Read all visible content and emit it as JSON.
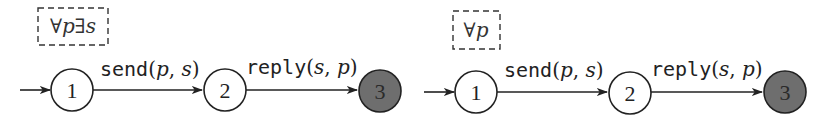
{
  "colors": {
    "stroke": "#222222",
    "final_fill": "#6e6e6e",
    "final_text": "#2a2a2a",
    "box_dash": "#333333"
  },
  "automata": [
    {
      "quantifier": "∀p∃s",
      "states": [
        {
          "label": "1",
          "initial": true,
          "final": false
        },
        {
          "label": "2",
          "initial": false,
          "final": false
        },
        {
          "label": "3",
          "initial": false,
          "final": true
        }
      ],
      "transitions": [
        {
          "from": "1",
          "to": "2",
          "action": "send",
          "args_open": "(",
          "arg1": "p",
          "sep": ", ",
          "arg2": "s",
          "args_close": ")"
        },
        {
          "from": "2",
          "to": "3",
          "action": "reply",
          "args_open": "(",
          "arg1": "s",
          "sep": ", ",
          "arg2": "p",
          "args_close": ")"
        }
      ]
    },
    {
      "quantifier": "∀p",
      "states": [
        {
          "label": "1",
          "initial": true,
          "final": false
        },
        {
          "label": "2",
          "initial": false,
          "final": false
        },
        {
          "label": "3",
          "initial": false,
          "final": true
        }
      ],
      "transitions": [
        {
          "from": "1",
          "to": "2",
          "action": "send",
          "args_open": "(",
          "arg1": "p",
          "sep": ", ",
          "arg2": "s",
          "args_close": ")"
        },
        {
          "from": "2",
          "to": "3",
          "action": "reply",
          "args_open": "(",
          "arg1": "s",
          "sep": ", ",
          "arg2": "p",
          "args_close": ")"
        }
      ]
    }
  ]
}
